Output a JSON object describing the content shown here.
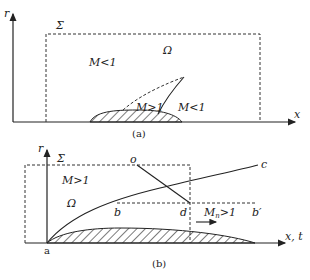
{
  "panel_a": {
    "caption": "(a)",
    "axis_y_label": "r",
    "axis_x_label": "x",
    "boundary_label": "Σ",
    "domain_label": "Ω",
    "region_upstream": "M<1",
    "region_supersonic": "M>1",
    "region_downstream": "M<1"
  },
  "panel_b": {
    "caption": "(b)",
    "axis_y_label": "r",
    "axis_x_label": "x, t",
    "boundary_label": "Σ",
    "domain_label": "Ω",
    "region_label": "M>1",
    "normal_mach_label": "M",
    "normal_mach_sub": "n",
    "normal_mach_rest": ">1",
    "point_o": "o",
    "point_c": "c",
    "point_b": "b",
    "point_d": "d",
    "point_b_prime": "b′",
    "point_a": "a"
  }
}
